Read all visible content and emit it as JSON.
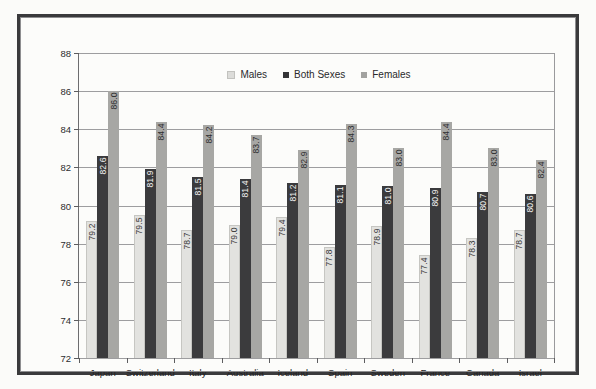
{
  "chart_data": {
    "type": "bar",
    "title": "",
    "subtitle": "",
    "xlabel": "",
    "ylabel": "",
    "ylim": [
      72,
      88
    ],
    "ytick_step": 2,
    "yticks": [
      88,
      86,
      84,
      82,
      80,
      78,
      76,
      74,
      72
    ],
    "grid": true,
    "legend_position": "top-center",
    "categories": [
      "Japan",
      "Switzerland",
      "Italy",
      "Australia",
      "Iceland",
      "Spain",
      "Sweden",
      "France",
      "Canada",
      "Israel"
    ],
    "series": [
      {
        "name": "Males",
        "color": "#e2e2df",
        "values": [
          79.2,
          79.5,
          78.7,
          79.0,
          79.4,
          77.8,
          78.9,
          77.4,
          78.3,
          78.7
        ],
        "labels": [
          "79.2",
          "79.5",
          "78.7",
          "79.0",
          "79.4",
          "77.8",
          "78.9",
          "77.4",
          "78.3",
          "78.7"
        ]
      },
      {
        "name": "Both Sexes",
        "color": "#3b3b3d",
        "values": [
          82.6,
          81.9,
          81.5,
          81.4,
          81.2,
          81.1,
          81.0,
          80.9,
          80.7,
          80.6
        ],
        "labels": [
          "82.6",
          "81.9",
          "81.5",
          "81.4",
          "81.2",
          "81.1",
          "81.0",
          "80.9",
          "80.7",
          "80.6"
        ]
      },
      {
        "name": "Females",
        "color": "#a7a7a4",
        "values": [
          86.0,
          84.4,
          84.2,
          83.7,
          82.9,
          84.3,
          83.0,
          84.4,
          83.0,
          82.4
        ],
        "labels": [
          "86.0",
          "84.4",
          "84.2",
          "83.7",
          "82.9",
          "84.3",
          "83.0",
          "84.4",
          "83.0",
          "82.4"
        ]
      }
    ]
  },
  "legend": {
    "items": [
      {
        "label": "Males"
      },
      {
        "label": "Both Sexes"
      },
      {
        "label": "Females"
      }
    ]
  }
}
